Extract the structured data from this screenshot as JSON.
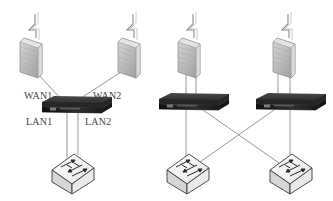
{
  "diagram": {
    "type": "network-topology",
    "left_topology": {
      "description": "Single dual-WAN router with two uplinks and two LAN links to one switch",
      "nodes": [
        {
          "id": "fw-l1",
          "kind": "firewall-with-wan-link",
          "icon": "firewall-icon"
        },
        {
          "id": "fw-l2",
          "kind": "firewall-with-wan-link",
          "icon": "firewall-icon"
        },
        {
          "id": "router-l",
          "kind": "router",
          "icon": "router-icon"
        },
        {
          "id": "switch-l",
          "kind": "switch",
          "icon": "switch-icon"
        }
      ],
      "labels": {
        "wan1": "WAN1",
        "wan2": "WAN2",
        "lan1": "LAN1",
        "lan2": "LAN2"
      },
      "links": [
        {
          "from": "fw-l1",
          "to": "router-l",
          "label": "WAN1"
        },
        {
          "from": "fw-l2",
          "to": "router-l",
          "label": "WAN2"
        },
        {
          "from": "router-l",
          "to": "switch-l",
          "label": "LAN1"
        },
        {
          "from": "router-l",
          "to": "switch-l",
          "label": "LAN2"
        }
      ]
    },
    "right_topology": {
      "description": "Two routers each with own uplink, cross-connected to two switches",
      "nodes": [
        {
          "id": "fw-r1",
          "kind": "firewall-with-wan-link",
          "icon": "firewall-icon"
        },
        {
          "id": "fw-r2",
          "kind": "firewall-with-wan-link",
          "icon": "firewall-icon"
        },
        {
          "id": "router-r1",
          "kind": "router",
          "icon": "router-icon"
        },
        {
          "id": "router-r2",
          "kind": "router",
          "icon": "router-icon"
        },
        {
          "id": "switch-r1",
          "kind": "switch",
          "icon": "switch-icon"
        },
        {
          "id": "switch-r2",
          "kind": "switch",
          "icon": "switch-icon"
        }
      ],
      "links": [
        {
          "from": "fw-r1",
          "to": "router-r1"
        },
        {
          "from": "fw-r2",
          "to": "router-r2"
        },
        {
          "from": "router-r1",
          "to": "switch-r1"
        },
        {
          "from": "router-r1",
          "to": "switch-r2"
        },
        {
          "from": "router-r2",
          "to": "switch-r1"
        },
        {
          "from": "router-r2",
          "to": "switch-r2"
        }
      ]
    },
    "colors": {
      "line": "#8a8a8a",
      "firewall_face": "#bdbdbd",
      "router_body": "#2a2a2a",
      "switch_face": "#f2f2f2",
      "label": "#444444"
    }
  }
}
